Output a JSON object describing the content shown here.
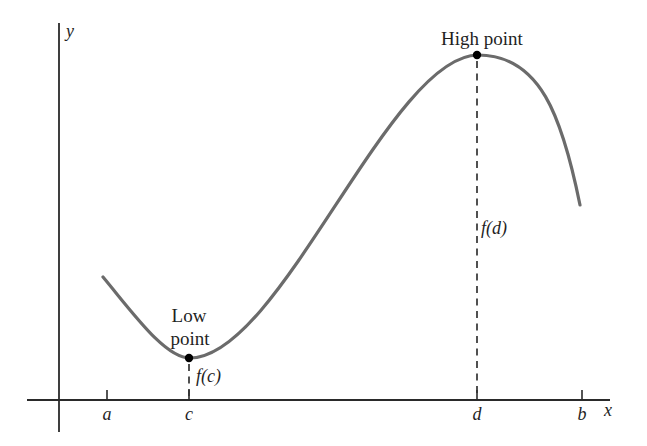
{
  "figure": {
    "background": "#ffffff",
    "colors": {
      "curve": "#6b6b6b",
      "axis": "#2a2a2a",
      "dashed_line": "#333333",
      "marker_dot": "#000000",
      "text": "#1f1f1f"
    },
    "y_axis_label": "y",
    "x_axis_label": "x",
    "x_ticks": [
      {
        "label": "a",
        "x": 107
      },
      {
        "label": "c",
        "x": 189
      },
      {
        "label": "d",
        "x": 477
      },
      {
        "label": "b",
        "x": 582
      }
    ],
    "low_point": {
      "label_line1": "Low",
      "label_line2": "point",
      "value_label": "f(c)",
      "at_tick": "c"
    },
    "high_point": {
      "label": "High point",
      "value_label": "f(d)",
      "at_tick": "d"
    }
  },
  "chart_data": {
    "type": "line",
    "title": "",
    "xlabel": "x",
    "ylabel": "y",
    "x_tick_labels": [
      "a",
      "c",
      "d",
      "b"
    ],
    "annotations": [
      "Low point",
      "High point",
      "f(c)",
      "f(d)"
    ],
    "curve_keypoints_px": [
      [
        103,
        277
      ],
      [
        189,
        358
      ],
      [
        280,
        287
      ],
      [
        330,
        223
      ],
      [
        380,
        140
      ],
      [
        477,
        55
      ],
      [
        580,
        205
      ]
    ]
  }
}
